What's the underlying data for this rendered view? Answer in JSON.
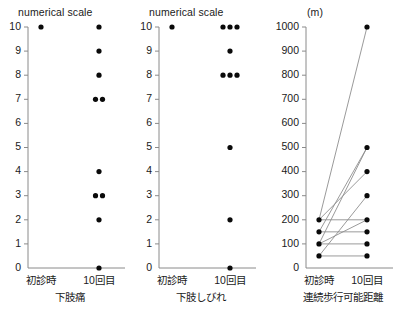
{
  "figure": {
    "panel_count": 3,
    "background": "#ffffff",
    "dot_color": "#0a0a0a",
    "axis_color": "#8a8a8a",
    "line_color": "#8f8f8f"
  },
  "chart_data": [
    {
      "type": "scatter",
      "title": "",
      "ylabel": "numerical scale",
      "xlabel": "下肢痛",
      "categories": [
        "初診時",
        "10回目"
      ],
      "ylim": [
        0,
        10
      ],
      "yticks": [
        0,
        1,
        2,
        3,
        4,
        5,
        6,
        7,
        8,
        9,
        10
      ],
      "ytick_labels": [
        "0",
        "1",
        "2",
        "3",
        "4",
        "5",
        "6",
        "7",
        "8",
        "9",
        "10"
      ],
      "grid": false,
      "legend": "none",
      "points": [
        {
          "x": "初診時",
          "y": 10,
          "count": 1
        },
        {
          "x": "10回目",
          "y": 10,
          "count": 1
        },
        {
          "x": "10回目",
          "y": 9,
          "count": 1
        },
        {
          "x": "10回目",
          "y": 8,
          "count": 1
        },
        {
          "x": "10回目",
          "y": 7,
          "count": 2
        },
        {
          "x": "10回目",
          "y": 4,
          "count": 1
        },
        {
          "x": "10回目",
          "y": 3,
          "count": 2
        },
        {
          "x": "10回目",
          "y": 2,
          "count": 1
        },
        {
          "x": "10回目",
          "y": 0,
          "count": 1
        }
      ]
    },
    {
      "type": "scatter",
      "title": "",
      "ylabel": "numerical scale",
      "xlabel": "下肢しびれ",
      "categories": [
        "初診時",
        "10回目"
      ],
      "ylim": [
        0,
        10
      ],
      "yticks": [
        0,
        1,
        2,
        3,
        4,
        5,
        6,
        7,
        8,
        9,
        10
      ],
      "ytick_labels": [
        "0",
        "1",
        "2",
        "3",
        "4",
        "5",
        "6",
        "7",
        "8",
        "9",
        "10"
      ],
      "grid": false,
      "legend": "none",
      "points": [
        {
          "x": "初診時",
          "y": 10,
          "count": 1
        },
        {
          "x": "10回目",
          "y": 10,
          "count": 3
        },
        {
          "x": "10回目",
          "y": 9,
          "count": 1
        },
        {
          "x": "10回目",
          "y": 8,
          "count": 3
        },
        {
          "x": "10回目",
          "y": 5,
          "count": 1
        },
        {
          "x": "10回目",
          "y": 2,
          "count": 1
        },
        {
          "x": "10回目",
          "y": 0,
          "count": 1
        }
      ]
    },
    {
      "type": "line",
      "title": "",
      "ylabel": "(m)",
      "xlabel": "連続歩行可能距離",
      "categories": [
        "初診時",
        "10回目"
      ],
      "ylim": [
        0,
        1000
      ],
      "yticks": [
        0,
        100,
        200,
        300,
        400,
        500,
        600,
        700,
        800,
        900,
        1000
      ],
      "ytick_labels": [
        "0",
        "100",
        "200",
        "300",
        "400",
        "500",
        "600",
        "700",
        "800",
        "900",
        "1000"
      ],
      "grid": false,
      "legend": "none",
      "series": [
        {
          "name": "case-1",
          "values": [
            200,
            1000
          ]
        },
        {
          "name": "case-2",
          "values": [
            100,
            500
          ]
        },
        {
          "name": "case-3",
          "values": [
            150,
            500
          ]
        },
        {
          "name": "case-4",
          "values": [
            200,
            400
          ]
        },
        {
          "name": "case-5",
          "values": [
            50,
            300
          ]
        },
        {
          "name": "case-6",
          "values": [
            100,
            200
          ]
        },
        {
          "name": "case-7",
          "values": [
            200,
            200
          ]
        },
        {
          "name": "case-8",
          "values": [
            150,
            150
          ]
        },
        {
          "name": "case-9",
          "values": [
            100,
            100
          ]
        },
        {
          "name": "case-10",
          "values": [
            50,
            50
          ]
        }
      ]
    }
  ]
}
